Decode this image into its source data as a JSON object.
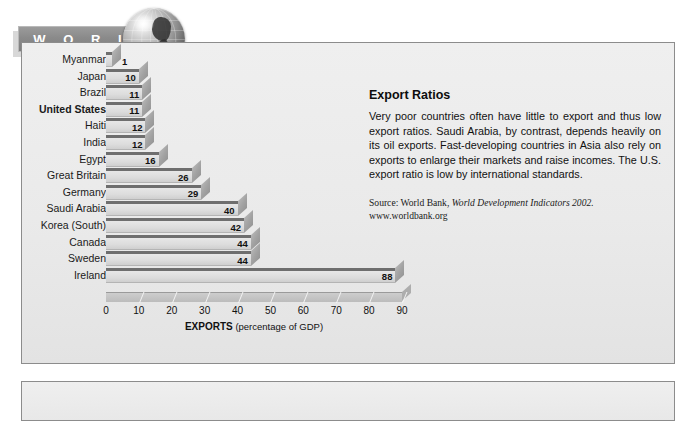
{
  "banner": {
    "left_text": "W O R L D",
    "right_text": "V I E W",
    "globe_icon": "globe-icon"
  },
  "article": {
    "heading": "Export Ratios",
    "body": "Very poor countries often have little to export and thus low export ratios. Saudi Arabia, by contrast, depends heavily on its oil exports. Fast-developing countries in Asia also rely on exports to enlarge their markets and raise incomes. The U.S. export ratio is low by international standards.",
    "source_prefix": "Source: World Bank, ",
    "source_italic": "World Development Indicators 2002.",
    "source_url": "www.worldbank.org"
  },
  "chart_data": {
    "type": "bar",
    "orientation": "horizontal",
    "title": "Export Ratios",
    "xlabel": "EXPORTS (percentage of GDP)",
    "xlabel_bold": "EXPORTS",
    "xlabel_rest": " (percentage of GDP)",
    "ylabel": "",
    "xlim": [
      0,
      90
    ],
    "xticks": [
      0,
      10,
      20,
      30,
      40,
      50,
      60,
      70,
      80,
      90
    ],
    "grid": false,
    "legend": false,
    "highlight_category": "United States",
    "categories": [
      "Myanmar",
      "Japan",
      "Brazil",
      "United States",
      "Haiti",
      "India",
      "Egypt",
      "Great Britain",
      "Germany",
      "Saudi Arabia",
      "Korea (South)",
      "Canada",
      "Sweden",
      "Ireland"
    ],
    "values": [
      1,
      10,
      11,
      11,
      12,
      12,
      16,
      26,
      29,
      40,
      42,
      44,
      44,
      88
    ],
    "value_labels": [
      "1",
      "10",
      "11",
      "11",
      "12",
      "12",
      "16",
      "26",
      "29",
      "40",
      "42",
      "44",
      "44",
      "88"
    ]
  },
  "colors": {
    "panel_bg": "#ededed",
    "panel_border": "#8c8c8c",
    "banner_gray": "#8c8c8c",
    "bar_face": "#dcdcdc",
    "bar_top": "#6e6e6e",
    "bar_side": "#a3a3a3",
    "text": "#111111"
  }
}
